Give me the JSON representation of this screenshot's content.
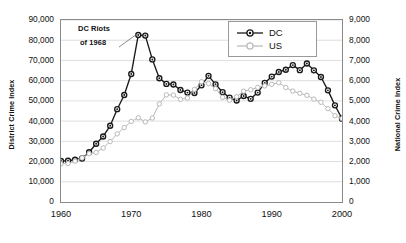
{
  "chart_data": {
    "type": "line",
    "title": "",
    "xlabel": "",
    "ylabel": "District Crime Index",
    "y2label": "National Crime Index",
    "xlim": [
      1960,
      2000
    ],
    "ylim": [
      0,
      90000
    ],
    "y2lim": [
      0,
      9000
    ],
    "grid": true,
    "legend_position": "top-right",
    "x_ticks": [
      "1960",
      "1970",
      "1980",
      "1990",
      "2000"
    ],
    "y_ticks": [
      "0",
      "10,000",
      "20,000",
      "30,000",
      "40,000",
      "50,000",
      "60,000",
      "70,000",
      "80,000",
      "90,000"
    ],
    "y2_ticks": [
      "0",
      "1,000",
      "2,000",
      "3,000",
      "4,000",
      "5,000",
      "6,000",
      "7,000",
      "8,000",
      "9,000"
    ],
    "x": [
      1960,
      1961,
      1962,
      1963,
      1964,
      1965,
      1966,
      1967,
      1968,
      1969,
      1970,
      1971,
      1972,
      1973,
      1974,
      1975,
      1976,
      1977,
      1978,
      1979,
      1980,
      1981,
      1982,
      1983,
      1984,
      1985,
      1986,
      1987,
      1988,
      1989,
      1990,
      1991,
      1992,
      1993,
      1994,
      1995,
      1996,
      1997,
      1998,
      1999,
      2000
    ],
    "series": [
      {
        "name": "DC",
        "axis": "left",
        "color": "#1a1a1a",
        "marker": "circle-filled-outline",
        "values": [
          20300,
          20400,
          20900,
          21500,
          24600,
          28800,
          32400,
          37700,
          45900,
          52900,
          63300,
          82600,
          82300,
          70500,
          61200,
          58400,
          58100,
          55400,
          54100,
          53900,
          57700,
          62400,
          58200,
          54300,
          51600,
          50200,
          52400,
          51000,
          54100,
          58900,
          62000,
          64300,
          65400,
          67700,
          65200,
          68500,
          65100,
          61800,
          55200,
          47800,
          41200
        ]
      },
      {
        "name": "US",
        "axis": "right",
        "color": "#b9b9b9",
        "marker": "circle-open",
        "values": [
          1887,
          1906,
          2020,
          2180,
          2388,
          2449,
          2671,
          2990,
          3370,
          3680,
          3985,
          4165,
          3961,
          4154,
          4850,
          5298,
          5287,
          5078,
          5140,
          5566,
          5950,
          5858,
          5604,
          5175,
          5031,
          5207,
          5480,
          5550,
          5664,
          5741,
          5820,
          5898,
          5660,
          5484,
          5374,
          5275,
          5087,
          4930,
          4616,
          4267,
          4125
        ]
      }
    ],
    "annotations": [
      {
        "text_line1": "DC Riots",
        "text_line2": "of 1968",
        "points_to_x": 1969,
        "points_to_y": 82600
      }
    ]
  },
  "legend": {
    "items": [
      {
        "label": "DC"
      },
      {
        "label": "US"
      }
    ]
  }
}
